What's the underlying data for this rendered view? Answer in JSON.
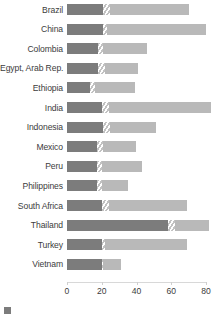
{
  "chart_data": {
    "type": "bar",
    "orientation": "horizontal",
    "stacked": true,
    "title": "",
    "xlabel": "",
    "ylabel": "",
    "xlim": [
      0,
      80
    ],
    "xticks": [
      0,
      20,
      40,
      60,
      80
    ],
    "xtick_labels": [
      "0",
      "20",
      "40",
      "60",
      "80"
    ],
    "grid": false,
    "legend_position": "bottom-left",
    "categories": [
      "Brazil",
      "China",
      "Colombia",
      "Egypt, Arab Rep.",
      "Ethiopia",
      "India",
      "Indonesia",
      "Mexico",
      "Peru",
      "Philippines",
      "South Africa",
      "Thailand",
      "Turkey",
      "Vietnam"
    ],
    "series": [
      {
        "name": "segment-dark",
        "values": [
          21,
          21,
          18,
          18,
          13,
          20,
          21,
          17,
          17,
          17,
          20,
          58,
          20,
          20
        ]
      },
      {
        "name": "segment-hatched",
        "values": [
          4,
          2,
          3,
          4,
          3,
          4,
          4,
          4,
          3,
          3,
          4,
          4,
          2,
          1
        ]
      },
      {
        "name": "segment-light",
        "values": [
          45,
          57,
          25,
          19,
          23,
          59,
          26,
          19,
          23,
          15,
          45,
          20,
          47,
          10
        ]
      }
    ],
    "totals": [
      70,
      80,
      46,
      41,
      39,
      83,
      51,
      40,
      43,
      35,
      69,
      82,
      69,
      31
    ],
    "legend_entries": [
      {
        "label": "segment-dark",
        "color": "#7c7c7c"
      },
      {
        "label": "segment-hatched",
        "color": "#c2c2c2"
      },
      {
        "label": "segment-light",
        "color": "#b9b9b9"
      }
    ]
  },
  "legend": {
    "caption": ""
  },
  "colors": {
    "dark": "#7c7c7c",
    "light": "#b9b9b9",
    "hatch": "#c2c2c2",
    "text": "#3c3c3c",
    "axis": "#d8d8d8",
    "background": "#ffffff"
  }
}
